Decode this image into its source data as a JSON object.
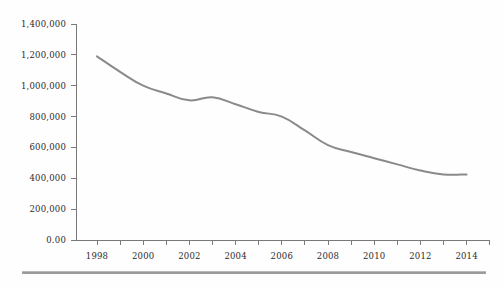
{
  "chart_data": {
    "type": "line",
    "title": "",
    "subtitle": "",
    "xlabel": "",
    "ylabel": "",
    "grid": false,
    "legend": "none",
    "line_color": "#8a8a8a",
    "axis_color": "#7a7a7a",
    "text_color": "#2b2b2b",
    "xlim": [
      1997,
      2015
    ],
    "ylim": [
      0,
      1400000
    ],
    "x_tick_step": 1,
    "x_label_step": 2,
    "y_tick_step": 200000,
    "y_tick_labels": [
      "1,400,000",
      "1,200,000",
      "1,000,000",
      "800,000",
      "600,000",
      "400,000",
      "200,000",
      "0.00"
    ],
    "y_tick_values": [
      1400000,
      1200000,
      1000000,
      800000,
      600000,
      400000,
      200000,
      0
    ],
    "x_tick_labels": [
      "1998",
      "",
      "2000",
      "",
      "2002",
      "",
      "2004",
      "",
      "2006",
      "",
      "2008",
      "",
      "2010",
      "",
      "2012",
      "",
      "2014",
      ""
    ],
    "x_tick_values": [
      1998,
      1999,
      2000,
      2001,
      2002,
      2003,
      2004,
      2005,
      2006,
      2007,
      2008,
      2009,
      2010,
      2011,
      2012,
      2013,
      2014,
      2015
    ],
    "labeled_x_ticks": [
      "1998",
      "2000",
      "2002",
      "2004",
      "2006",
      "2008",
      "2010",
      "2012",
      "2014"
    ],
    "x": [
      1998,
      1999,
      2000,
      2001,
      2002,
      2003,
      2004,
      2005,
      2006,
      2007,
      2008,
      2009,
      2010,
      2011,
      2012,
      2013,
      2014
    ],
    "values": [
      1190000,
      1090000,
      1000000,
      950000,
      905000,
      925000,
      880000,
      830000,
      800000,
      710000,
      615000,
      570000,
      530000,
      490000,
      450000,
      425000,
      425000
    ],
    "series": [
      {
        "name": "",
        "values": [
          1190000,
          1090000,
          1000000,
          950000,
          905000,
          925000,
          880000,
          830000,
          800000,
          710000,
          615000,
          570000,
          530000,
          490000,
          450000,
          425000,
          425000
        ]
      }
    ]
  },
  "decoration": {
    "bottom_rule_color": "#9a9a9c"
  }
}
